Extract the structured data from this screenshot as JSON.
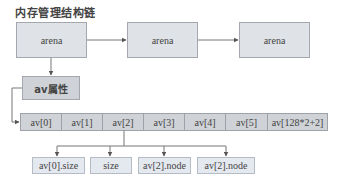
{
  "title": "内存管理结构链",
  "arenas": [
    {
      "label": "arena"
    },
    {
      "label": "arena"
    },
    {
      "label": "arena"
    }
  ],
  "av_property": {
    "label": "av属性"
  },
  "av_array": {
    "cells": [
      {
        "label": "av[0]"
      },
      {
        "label": "av[1]"
      },
      {
        "label": "av[2]"
      },
      {
        "label": "av[3]"
      },
      {
        "label": "av[4]"
      },
      {
        "label": "av[5]"
      },
      {
        "label": "av[128*2+2]"
      }
    ]
  },
  "av2_children": [
    {
      "label": "av[0].size"
    },
    {
      "label": "size"
    },
    {
      "label": "av[2].node"
    },
    {
      "label": "av[2].node"
    }
  ],
  "colors": {
    "box_fill": "#dfe2e7",
    "box_border": "#a4a8ae",
    "row_fill": "#cfd2d6",
    "sub_fill": "#e4e8ef",
    "line": "#555555"
  }
}
